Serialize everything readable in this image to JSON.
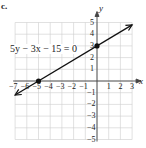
{
  "problem_marker": "c.",
  "chart_data": {
    "type": "line",
    "title": "",
    "equation": "5y − 3x − 15 = 0",
    "xlabel": "x",
    "ylabel": "y",
    "xlim": [
      -7,
      3
    ],
    "ylim": [
      -5,
      5
    ],
    "grid": true,
    "x_ticks": [
      -7,
      -6,
      -5,
      -4,
      -3,
      -2,
      -1,
      1,
      2,
      3
    ],
    "y_ticks": [
      -5,
      -4,
      -3,
      -2,
      -1,
      1,
      2,
      3,
      4,
      5
    ],
    "series": [
      {
        "name": "5y − 3x − 15 = 0",
        "x": [
          -7,
          3
        ],
        "y": [
          -1.2,
          4.8
        ],
        "slope": 0.6,
        "intercept": 3
      }
    ],
    "points": [
      {
        "x": -5,
        "y": 0,
        "label": "x-intercept"
      },
      {
        "x": 0,
        "y": 3,
        "label": "y-intercept"
      }
    ]
  },
  "labels": {
    "equation": "5y − 3x − 15 = 0",
    "x_axis": "x",
    "y_axis": "y"
  }
}
